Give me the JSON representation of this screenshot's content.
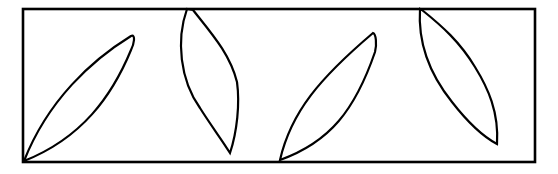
{
  "diagram": {
    "width": 558,
    "height": 174,
    "stroke_color": "#000000",
    "background": "#ffffff",
    "frame": {
      "x": 23,
      "y": 9,
      "width": 512,
      "height": 153,
      "stroke_width": 2.6
    },
    "shapes": [
      {
        "name": "leaf-1",
        "path": "M24,161 C48,100 92,60 131,36 C136,34 134,44 131,50 C112,96 82,138 24,161 Z"
      },
      {
        "name": "leaf-2",
        "path": "M187,9 C176,40 180,80 200,108 C210,124 222,140 230,153 C237,132 240,104 237,82 C230,54 212,34 193,10 Z"
      },
      {
        "name": "leaf-3",
        "path": "M280,160 C291,112 320,78 373,33 C376,34 377,44 375,52 C355,110 330,142 280,160 Z"
      },
      {
        "name": "leaf-4",
        "path": "M420,9 C418,40 428,72 452,102 C466,120 482,136 497,144 C499,112 488,88 475,67 C460,42 442,26 422,10 Z"
      }
    ]
  }
}
